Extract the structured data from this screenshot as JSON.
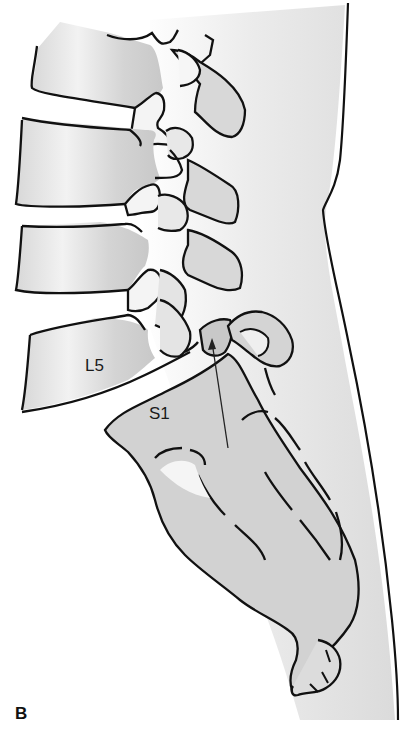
{
  "figure": {
    "panel_label": "B",
    "labels": {
      "l5": "L5",
      "s1": "S1"
    },
    "colors": {
      "outline": "#111111",
      "bone_fill": "#d6d6d6",
      "soft_tissue": "#e2e2e2",
      "highlight": "#f4f4f4"
    }
  }
}
